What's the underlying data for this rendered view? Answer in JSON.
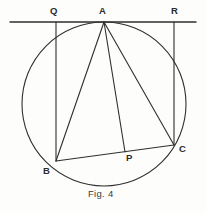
{
  "figure": {
    "caption": "Fig. 4",
    "caption_position": {
      "x": 88,
      "y": 188
    },
    "canvas": {
      "width": 206,
      "height": 212
    },
    "background_color": "#fdfdfc",
    "stroke_color": "#2f2f2f",
    "label_color": "#2b2b2b",
    "stroke_width": 1.1
  },
  "points": {
    "Q": {
      "label": "Q",
      "x": 56,
      "y": 22,
      "label_x": 50,
      "label_y": 6
    },
    "A": {
      "label": "A",
      "x": 104,
      "y": 22,
      "label_x": 99,
      "label_y": 6
    },
    "R": {
      "label": "R",
      "x": 174,
      "y": 22,
      "label_x": 171,
      "label_y": 6
    },
    "B": {
      "label": "B",
      "x": 56,
      "y": 161,
      "label_x": 43,
      "label_y": 166
    },
    "P": {
      "label": "P",
      "x": 125,
      "y": 152,
      "label_x": 126,
      "label_y": 153
    },
    "C": {
      "label": "C",
      "x": 174,
      "y": 145,
      "label_x": 179,
      "label_y": 144
    }
  },
  "circle": {
    "name": "circumcircle",
    "center_x": 104,
    "center_y": 104,
    "radius": 82
  },
  "segments": [
    {
      "name": "tangent-line-QR",
      "x1": 10,
      "y1": 22,
      "x2": 196,
      "y2": 22
    },
    {
      "name": "segment-QB",
      "x1": 56,
      "y1": 22,
      "x2": 56,
      "y2": 161
    },
    {
      "name": "segment-RC",
      "x1": 174,
      "y1": 22,
      "x2": 174,
      "y2": 145
    },
    {
      "name": "segment-AB",
      "x1": 104,
      "y1": 22,
      "x2": 56,
      "y2": 161
    },
    {
      "name": "segment-AP",
      "x1": 104,
      "y1": 22,
      "x2": 125,
      "y2": 152
    },
    {
      "name": "segment-AC",
      "x1": 104,
      "y1": 22,
      "x2": 174,
      "y2": 145
    },
    {
      "name": "segment-BC",
      "x1": 56,
      "y1": 161,
      "x2": 174,
      "y2": 145
    }
  ]
}
